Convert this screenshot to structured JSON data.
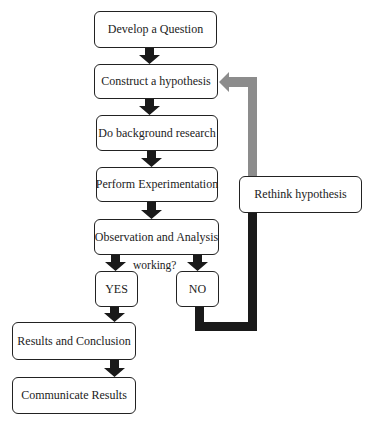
{
  "diagram": {
    "type": "flowchart",
    "colors": {
      "box_border": "#222222",
      "flow_arrow": "#1a1a1a",
      "feedback_gray": "#8c8c8c",
      "feedback_black": "#1a1a1a"
    },
    "steps": [
      {
        "id": "develop-question",
        "label": "Develop a Question"
      },
      {
        "id": "construct-hypothesis",
        "label": "Construct a hypothesis"
      },
      {
        "id": "background-research",
        "label": "Do background research"
      },
      {
        "id": "perform-experimentation",
        "label": "Perform Experimentation"
      },
      {
        "id": "observation-analysis",
        "label": "Observation and Analysis"
      },
      {
        "id": "yes",
        "label": "YES"
      },
      {
        "id": "no",
        "label": "NO"
      },
      {
        "id": "results-conclusion",
        "label": "Results and Conclusion"
      },
      {
        "id": "communicate-results",
        "label": "Communicate Results"
      },
      {
        "id": "rethink-hypothesis",
        "label": "Rethink hypothesis"
      }
    ],
    "decision_label": "working?",
    "edges": [
      [
        "develop-question",
        "construct-hypothesis"
      ],
      [
        "construct-hypothesis",
        "background-research"
      ],
      [
        "background-research",
        "perform-experimentation"
      ],
      [
        "perform-experimentation",
        "observation-analysis"
      ],
      [
        "observation-analysis",
        "yes"
      ],
      [
        "observation-analysis",
        "no"
      ],
      [
        "yes",
        "results-conclusion"
      ],
      [
        "results-conclusion",
        "communicate-results"
      ],
      [
        "no",
        "rethink-hypothesis"
      ],
      [
        "rethink-hypothesis",
        "construct-hypothesis"
      ]
    ]
  }
}
